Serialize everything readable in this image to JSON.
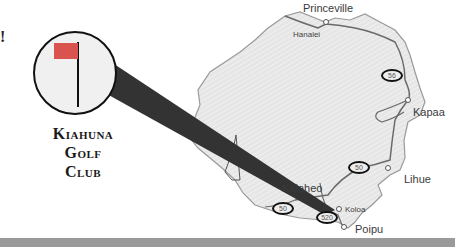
{
  "map": {
    "title_lines": [
      "Kiahuna",
      "Golf",
      "Club"
    ],
    "edge_glyph": "!",
    "towns": [
      {
        "name": "Princeville",
        "size": "big"
      },
      {
        "name": "Hanalei",
        "size": "sm"
      },
      {
        "name": "Kapaa",
        "size": "big"
      },
      {
        "name": "Lihue",
        "size": "big"
      },
      {
        "name": "Kalaheo",
        "size": "big"
      },
      {
        "name": "Koloa",
        "size": "sm"
      },
      {
        "name": "Poipu",
        "size": "big"
      }
    ],
    "route_shields": [
      "56",
      "50",
      "50",
      "520"
    ],
    "colors": {
      "land": "#e4e4e4",
      "coast": "#9a9a9a",
      "road": "#6a6a6a",
      "beam": "#333333",
      "flag": "#d9534f",
      "footer": "#9a9a9a"
    }
  }
}
